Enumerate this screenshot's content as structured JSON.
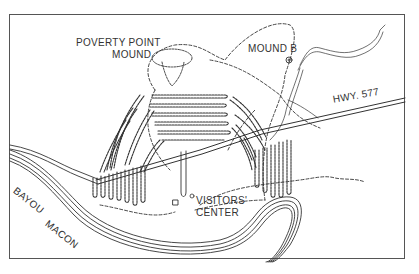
{
  "map": {
    "labels": {
      "poverty_point_line1": "POVERTY POINT",
      "poverty_point_line2": "MOUND",
      "mound_b": "MOUND B",
      "highway": "HWY. 577",
      "bayou_word1": "BAYOU",
      "bayou_word2": "MACON",
      "visitors_line1": "VISITORS'",
      "visitors_line2": "CENTER"
    },
    "colors": {
      "ink": "#333333",
      "frame": "#555555",
      "background": "#ffffff"
    }
  }
}
